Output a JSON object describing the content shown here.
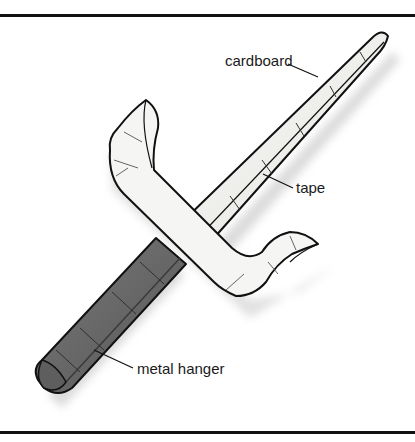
{
  "figure": {
    "labels": [
      {
        "id": "cardboard",
        "text": "cardboard"
      },
      {
        "id": "tape",
        "text": "tape"
      },
      {
        "id": "metal-hanger",
        "text": "metal hanger"
      }
    ]
  },
  "colors": {
    "outline": "#111111",
    "tape_fill": "#f4f4f2",
    "tape_shade": "#dcdcd8",
    "handle_fill": "#6a6a6a",
    "handle_dark": "#4a4a4a",
    "shadow": "#d6d6d6",
    "rule": "#111111"
  }
}
